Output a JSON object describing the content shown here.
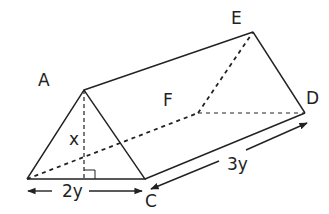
{
  "diagram": {
    "type": "triangular prism",
    "vertices": {
      "A": "A",
      "C": "C",
      "D": "D",
      "E": "E",
      "F": "F"
    },
    "dimensions": {
      "height": "x",
      "base": "2y",
      "length": "3y"
    },
    "colors": {
      "stroke": "#222222",
      "background": "#ffffff"
    }
  }
}
